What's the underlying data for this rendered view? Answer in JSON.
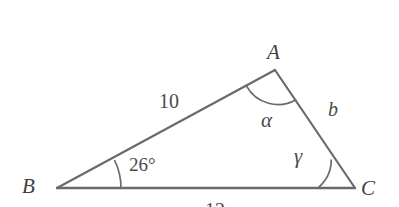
{
  "figure": {
    "kind": "triangle-diagram",
    "background_color": "#ffffff",
    "stroke_color": "#6a6a6a",
    "text_color": "#4a4a4a",
    "width": 399,
    "height": 207
  },
  "vertices": [
    {
      "id": "A",
      "label": "A",
      "x": 275,
      "y": 70
    },
    {
      "id": "B",
      "label": "B",
      "x": 57,
      "y": 188
    },
    {
      "id": "C",
      "label": "C",
      "x": 355,
      "y": 188
    }
  ],
  "sides": [
    {
      "id": "BA",
      "label": "10",
      "kind": "number",
      "from": "B",
      "to": "A"
    },
    {
      "id": "AC",
      "label": "b",
      "kind": "variable",
      "from": "A",
      "to": "C"
    },
    {
      "id": "BC",
      "label": "12",
      "kind": "number",
      "from": "B",
      "to": "C",
      "clipped": true
    }
  ],
  "angles": [
    {
      "id": "angle-B",
      "label": "26°",
      "kind": "number",
      "at": "B",
      "arc_radius": 64
    },
    {
      "id": "angle-A",
      "label": "α",
      "kind": "variable",
      "at": "A",
      "arc_radius": 36
    },
    {
      "id": "angle-C",
      "label": "γ",
      "kind": "variable",
      "at": "C",
      "arc_radius": 37
    }
  ]
}
